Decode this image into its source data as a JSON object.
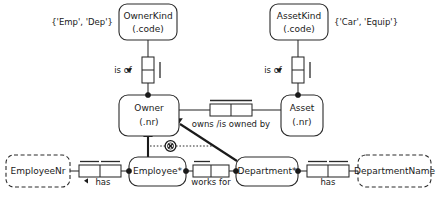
{
  "diagram": {
    "type": "orm-conceptual-schema",
    "colors": {
      "stroke": "#2b2b2b",
      "text": "#1a1a1a",
      "fill": "#ffffff",
      "accent": "#1a1a1a"
    }
  },
  "entities": {
    "owner_kind": {
      "name": "OwnerKind",
      "ref_mode": "(.code)"
    },
    "asset_kind": {
      "name": "AssetKind",
      "ref_mode": "(.code)"
    },
    "owner": {
      "name": "Owner",
      "ref_mode": "(.nr)"
    },
    "asset": {
      "name": "Asset",
      "ref_mode": "(.nr)"
    },
    "employee": {
      "name": "Employee*",
      "ref_mode": ""
    },
    "department": {
      "name": "Department*",
      "ref_mode": ""
    }
  },
  "value_types": {
    "employee_nr": {
      "name": "EmployeeNr"
    },
    "department_name": {
      "name": "DepartmentName"
    }
  },
  "value_constraints": {
    "owner_kind_values": "{'Emp', 'Dep'}",
    "asset_kind_values": "{'Car', 'Equip'}"
  },
  "predicates": {
    "owner_is_of_kind": {
      "label": "is of",
      "arrow": "▴"
    },
    "asset_is_of_kind": {
      "label": "is of",
      "arrow": "▴"
    },
    "owns": {
      "label": "owns /is owned by"
    },
    "employee_has_nr": {
      "label": "has",
      "arrow": "◂"
    },
    "works_for": {
      "label": "works for"
    },
    "department_has_name": {
      "label": "has"
    }
  },
  "constraints": {
    "exclusion": {
      "symbol": "⊗",
      "name": "exclusion-constraint"
    }
  }
}
